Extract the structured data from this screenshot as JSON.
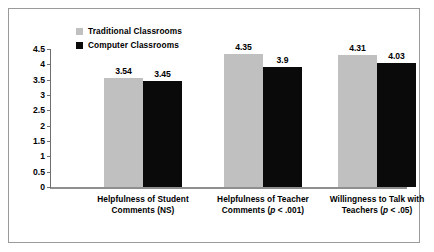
{
  "figure": {
    "background": "#ffffff",
    "frame_color": "#9a9a9a"
  },
  "legend": {
    "position": "top-left-inside",
    "items": [
      {
        "label": "Traditional Classrooms",
        "color": "#c0c0c0"
      },
      {
        "label": "Computer Classrooms",
        "color": "#0a0a0a"
      }
    ]
  },
  "axis": {
    "y_ticks": [
      "0",
      "0.5",
      "1",
      "1.5",
      "2",
      "2.5",
      "3",
      "3.5",
      "4",
      "4.5"
    ],
    "y_tick_values": [
      0,
      0.5,
      1,
      1.5,
      2,
      2.5,
      3,
      3.5,
      4,
      4.5
    ]
  },
  "categories": [
    {
      "line1": "Helpfulness of Student",
      "line2_pre": "Comments (NS)",
      "line2_italic": "",
      "line2_post": ""
    },
    {
      "line1": "Helpfulness of Teacher",
      "line2_pre": "Comments (",
      "line2_italic": "p",
      "line2_post": " < .001)"
    },
    {
      "line1": "Willingness to Talk with",
      "line2_pre": "Teachers (",
      "line2_italic": "p",
      "line2_post": " < .05)"
    }
  ],
  "bar_values": {
    "g0s0": "3.54",
    "g0s1": "3.45",
    "g1s0": "4.35",
    "g1s1": "3.9",
    "g2s0": "4.31",
    "g2s1": "4.03"
  },
  "chart_data": {
    "type": "bar",
    "title": "",
    "subtitle": "",
    "xlabel": "",
    "ylabel": "",
    "ylim": [
      0,
      4.5
    ],
    "grid": false,
    "legend_position": "upper left (inside plot)",
    "categories": [
      "Helpfulness of Student Comments (NS)",
      "Helpfulness of Teacher Comments (p < .001)",
      "Willingness to Talk with Teachers (p < .05)"
    ],
    "series": [
      {
        "name": "Traditional Classrooms",
        "color": "#c0c0c0",
        "values": [
          3.54,
          4.35,
          4.31
        ]
      },
      {
        "name": "Computer Classrooms",
        "color": "#0a0a0a",
        "values": [
          3.45,
          3.9,
          4.03
        ]
      }
    ],
    "y_ticks": [
      0,
      0.5,
      1,
      1.5,
      2,
      2.5,
      3,
      3.5,
      4,
      4.5
    ],
    "data_labels": [
      [
        "3.54",
        "3.45"
      ],
      [
        "4.35",
        "3.9"
      ],
      [
        "4.31",
        "4.03"
      ]
    ],
    "annotations": [
      "NS = not significant (group 1)",
      "p < .001 (group 2)",
      "p < .05 (group 3)"
    ]
  }
}
